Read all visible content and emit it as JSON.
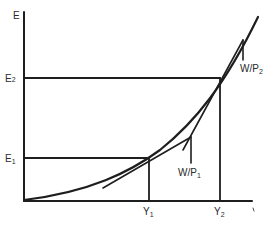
{
  "diagram": {
    "type": "economics-graph",
    "axes": {
      "y_label": "E",
      "x_label": ""
    },
    "levels": {
      "e1": {
        "label": "E",
        "sub": "1"
      },
      "e2": {
        "label": "E",
        "sub": "2"
      },
      "y1": {
        "label": "Y",
        "sub": "1"
      },
      "y2": {
        "label": "Y",
        "sub": "2"
      }
    },
    "tangents": {
      "wp1": {
        "label": "W/P",
        "sub": "1"
      },
      "wp2": {
        "label": "W/P",
        "sub": "2"
      }
    },
    "colors": {
      "ink": "#1e1e1e",
      "background": "#ffffff"
    }
  }
}
